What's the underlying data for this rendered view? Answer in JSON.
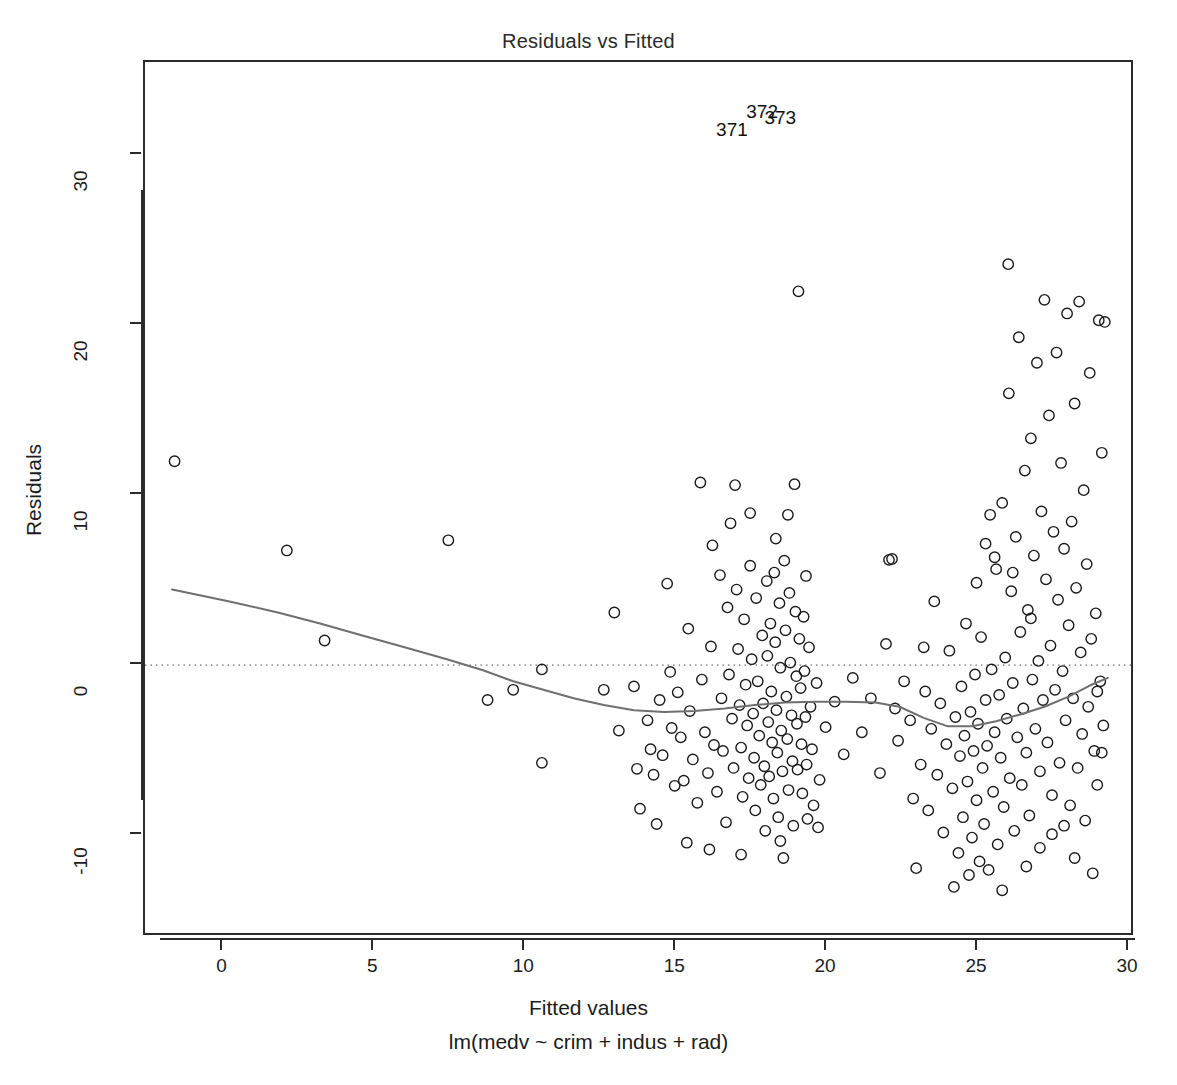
{
  "chart_data": {
    "type": "scatter",
    "title": "Residuals vs Fitted",
    "xlabel": "Fitted values",
    "sublabel": "lm(medv ~ crim + indus + rad)",
    "ylabel": "Residuals",
    "xlim": [
      -2.6,
      30.2
    ],
    "ylim": [
      -16.0,
      35.5
    ],
    "xticks": [
      0,
      5,
      10,
      15,
      20,
      25,
      30
    ],
    "yticks": [
      -10,
      0,
      10,
      20,
      30
    ],
    "grid": false,
    "legend": null,
    "reference_line": {
      "type": "horizontal-dotted",
      "y": 0,
      "color": "#9a9a9a"
    },
    "smoother": {
      "name": "loess",
      "color": "#6f6f6f",
      "width": 2,
      "points": [
        [
          -1.7,
          4.45
        ],
        [
          0.2,
          3.75
        ],
        [
          1.8,
          3.1
        ],
        [
          3.2,
          2.45
        ],
        [
          4.6,
          1.75
        ],
        [
          6.0,
          1.05
        ],
        [
          7.4,
          0.35
        ],
        [
          8.6,
          -0.3
        ],
        [
          9.6,
          -0.95
        ],
        [
          10.6,
          -1.45
        ],
        [
          11.6,
          -1.95
        ],
        [
          12.6,
          -2.35
        ],
        [
          13.6,
          -2.65
        ],
        [
          14.6,
          -2.75
        ],
        [
          15.6,
          -2.7
        ],
        [
          16.6,
          -2.55
        ],
        [
          17.6,
          -2.35
        ],
        [
          18.6,
          -2.2
        ],
        [
          19.6,
          -2.15
        ],
        [
          20.6,
          -2.15
        ],
        [
          21.6,
          -2.2
        ],
        [
          22.4,
          -2.45
        ],
        [
          23.2,
          -3.1
        ],
        [
          24.0,
          -3.6
        ],
        [
          24.8,
          -3.6
        ],
        [
          25.6,
          -3.3
        ],
        [
          26.4,
          -2.9
        ],
        [
          27.2,
          -2.45
        ],
        [
          28.0,
          -1.85
        ],
        [
          28.7,
          -1.2
        ],
        [
          29.3,
          -0.75
        ]
      ]
    },
    "point_labels": [
      {
        "text": "371",
        "x": 17.05,
        "y": 31.3
      },
      {
        "text": "372",
        "x": 18.05,
        "y": 32.4
      },
      {
        "text": "373",
        "x": 18.65,
        "y": 32.0
      }
    ],
    "marker": {
      "shape": "open-circle",
      "radius": 5.2,
      "color": "#1a1a1a",
      "stroke_width": 1.4
    },
    "points": [
      [
        -1.62,
        12.0
      ],
      [
        2.1,
        6.75
      ],
      [
        3.35,
        1.45
      ],
      [
        7.45,
        7.35
      ],
      [
        8.75,
        -2.05
      ],
      [
        9.6,
        -1.45
      ],
      [
        10.55,
        -0.25
      ],
      [
        10.55,
        -5.75
      ],
      [
        12.95,
        3.1
      ],
      [
        13.6,
        -1.25
      ],
      [
        13.7,
        -6.1
      ],
      [
        13.8,
        -8.45
      ],
      [
        14.05,
        -3.25
      ],
      [
        14.15,
        -4.95
      ],
      [
        14.25,
        -6.45
      ],
      [
        14.45,
        -2.05
      ],
      [
        14.55,
        -5.3
      ],
      [
        14.7,
        4.8
      ],
      [
        14.8,
        -0.4
      ],
      [
        14.85,
        -3.7
      ],
      [
        14.95,
        -7.1
      ],
      [
        15.05,
        -1.6
      ],
      [
        15.15,
        -4.25
      ],
      [
        15.25,
        -6.8
      ],
      [
        15.4,
        2.15
      ],
      [
        15.45,
        -2.7
      ],
      [
        15.55,
        -5.55
      ],
      [
        15.7,
        -8.1
      ],
      [
        15.8,
        10.75
      ],
      [
        15.85,
        -0.85
      ],
      [
        15.95,
        -3.95
      ],
      [
        16.05,
        -6.35
      ],
      [
        16.15,
        1.1
      ],
      [
        16.25,
        -4.7
      ],
      [
        16.35,
        -7.45
      ],
      [
        16.45,
        5.3
      ],
      [
        16.5,
        -1.95
      ],
      [
        16.55,
        -5.05
      ],
      [
        16.65,
        -9.25
      ],
      [
        16.7,
        3.4
      ],
      [
        16.75,
        -0.55
      ],
      [
        16.85,
        -3.15
      ],
      [
        16.9,
        -6.05
      ],
      [
        16.95,
        10.6
      ],
      [
        17.0,
        4.45
      ],
      [
        17.05,
        0.95
      ],
      [
        17.1,
        -2.35
      ],
      [
        17.15,
        -4.85
      ],
      [
        17.2,
        -7.75
      ],
      [
        17.25,
        2.7
      ],
      [
        17.3,
        -1.15
      ],
      [
        17.35,
        -3.55
      ],
      [
        17.4,
        -6.65
      ],
      [
        17.45,
        5.85
      ],
      [
        17.5,
        0.35
      ],
      [
        17.55,
        -2.85
      ],
      [
        17.58,
        -5.45
      ],
      [
        17.62,
        -8.55
      ],
      [
        17.65,
        3.95
      ],
      [
        17.7,
        -0.95
      ],
      [
        17.75,
        -4.15
      ],
      [
        17.8,
        -7.05
      ],
      [
        17.85,
        1.75
      ],
      [
        17.88,
        -2.25
      ],
      [
        17.92,
        -5.95
      ],
      [
        17.95,
        -9.75
      ],
      [
        18.0,
        4.95
      ],
      [
        18.02,
        0.55
      ],
      [
        18.05,
        -3.35
      ],
      [
        18.08,
        -6.55
      ],
      [
        18.12,
        2.45
      ],
      [
        18.15,
        -1.55
      ],
      [
        18.18,
        -4.55
      ],
      [
        18.22,
        -7.85
      ],
      [
        18.25,
        5.45
      ],
      [
        18.28,
        1.35
      ],
      [
        18.32,
        -2.65
      ],
      [
        18.35,
        -5.15
      ],
      [
        18.38,
        -8.95
      ],
      [
        18.42,
        3.65
      ],
      [
        18.45,
        -0.15
      ],
      [
        18.48,
        -3.85
      ],
      [
        18.52,
        -6.25
      ],
      [
        18.55,
        -11.35
      ],
      [
        18.58,
        6.15
      ],
      [
        18.62,
        2.05
      ],
      [
        18.65,
        -1.85
      ],
      [
        18.68,
        -4.35
      ],
      [
        18.72,
        -7.35
      ],
      [
        18.75,
        4.25
      ],
      [
        18.78,
        0.15
      ],
      [
        18.82,
        -2.95
      ],
      [
        18.85,
        -5.65
      ],
      [
        18.88,
        -9.45
      ],
      [
        18.92,
        10.65
      ],
      [
        18.95,
        3.15
      ],
      [
        18.98,
        -0.65
      ],
      [
        19.0,
        -3.45
      ],
      [
        19.02,
        -6.15
      ],
      [
        19.05,
        22.0
      ],
      [
        19.08,
        1.55
      ],
      [
        19.12,
        -1.35
      ],
      [
        19.15,
        -4.65
      ],
      [
        19.18,
        -7.55
      ],
      [
        19.22,
        2.85
      ],
      [
        19.25,
        -0.35
      ],
      [
        19.28,
        -3.05
      ],
      [
        19.32,
        -5.85
      ],
      [
        19.35,
        -9.05
      ],
      [
        19.4,
        1.05
      ],
      [
        19.45,
        -2.45
      ],
      [
        19.5,
        -4.95
      ],
      [
        19.55,
        -8.25
      ],
      [
        19.65,
        -1.05
      ],
      [
        19.75,
        -6.75
      ],
      [
        19.95,
        -3.65
      ],
      [
        20.25,
        -2.15
      ],
      [
        20.55,
        -5.25
      ],
      [
        20.85,
        -0.75
      ],
      [
        21.15,
        -3.95
      ],
      [
        21.45,
        -1.95
      ],
      [
        21.75,
        -6.35
      ],
      [
        21.95,
        1.25
      ],
      [
        22.05,
        6.2
      ],
      [
        22.15,
        6.25
      ],
      [
        22.25,
        -2.55
      ],
      [
        22.35,
        -4.45
      ],
      [
        22.55,
        -0.95
      ],
      [
        22.75,
        -3.25
      ],
      [
        22.95,
        -11.95
      ],
      [
        23.1,
        -5.85
      ],
      [
        23.25,
        -1.55
      ],
      [
        23.35,
        -8.55
      ],
      [
        23.45,
        -3.75
      ],
      [
        23.55,
        3.75
      ],
      [
        23.65,
        -6.45
      ],
      [
        23.75,
        -2.25
      ],
      [
        23.85,
        -9.85
      ],
      [
        23.95,
        -4.65
      ],
      [
        24.05,
        0.85
      ],
      [
        24.15,
        -7.25
      ],
      [
        24.25,
        -3.05
      ],
      [
        24.35,
        -11.05
      ],
      [
        24.4,
        -5.35
      ],
      [
        24.45,
        -1.25
      ],
      [
        24.5,
        -8.95
      ],
      [
        24.55,
        -4.15
      ],
      [
        24.6,
        2.45
      ],
      [
        24.65,
        -6.85
      ],
      [
        24.7,
        -12.35
      ],
      [
        24.75,
        -2.75
      ],
      [
        24.8,
        -10.15
      ],
      [
        24.85,
        -5.05
      ],
      [
        24.9,
        -0.55
      ],
      [
        24.95,
        -7.95
      ],
      [
        25.0,
        -3.45
      ],
      [
        25.05,
        -11.55
      ],
      [
        25.1,
        1.65
      ],
      [
        25.15,
        -6.05
      ],
      [
        25.2,
        -9.35
      ],
      [
        25.25,
        -2.05
      ],
      [
        25.3,
        -4.75
      ],
      [
        25.35,
        -12.05
      ],
      [
        25.4,
        8.85
      ],
      [
        25.45,
        -0.25
      ],
      [
        25.5,
        -7.45
      ],
      [
        25.55,
        -3.95
      ],
      [
        25.6,
        5.65
      ],
      [
        25.65,
        -10.55
      ],
      [
        25.7,
        -1.75
      ],
      [
        25.75,
        -5.45
      ],
      [
        25.8,
        9.55
      ],
      [
        25.85,
        -8.35
      ],
      [
        25.9,
        0.45
      ],
      [
        25.95,
        -3.15
      ],
      [
        26.0,
        23.6
      ],
      [
        26.02,
        16.0
      ],
      [
        26.05,
        -6.65
      ],
      [
        26.1,
        4.35
      ],
      [
        26.15,
        -1.05
      ],
      [
        26.2,
        -9.75
      ],
      [
        26.25,
        7.55
      ],
      [
        26.3,
        -4.25
      ],
      [
        26.35,
        19.3
      ],
      [
        26.4,
        1.95
      ],
      [
        26.45,
        -7.05
      ],
      [
        26.5,
        -2.55
      ],
      [
        26.55,
        11.45
      ],
      [
        26.6,
        -5.15
      ],
      [
        26.65,
        3.25
      ],
      [
        26.7,
        -8.85
      ],
      [
        26.75,
        13.35
      ],
      [
        26.8,
        -0.85
      ],
      [
        26.85,
        6.45
      ],
      [
        26.9,
        -3.75
      ],
      [
        26.95,
        17.8
      ],
      [
        27.0,
        0.25
      ],
      [
        27.05,
        -6.25
      ],
      [
        27.1,
        9.05
      ],
      [
        27.15,
        -2.05
      ],
      [
        27.2,
        21.5
      ],
      [
        27.25,
        5.05
      ],
      [
        27.3,
        -4.55
      ],
      [
        27.35,
        14.7
      ],
      [
        27.4,
        1.15
      ],
      [
        27.45,
        -7.65
      ],
      [
        27.5,
        7.85
      ],
      [
        27.55,
        -1.45
      ],
      [
        27.6,
        18.4
      ],
      [
        27.65,
        3.85
      ],
      [
        27.7,
        -5.75
      ],
      [
        27.75,
        11.9
      ],
      [
        27.8,
        -0.35
      ],
      [
        27.85,
        6.85
      ],
      [
        27.9,
        -3.25
      ],
      [
        27.95,
        20.7
      ],
      [
        28.0,
        2.35
      ],
      [
        28.05,
        -8.25
      ],
      [
        28.1,
        8.45
      ],
      [
        28.15,
        -1.95
      ],
      [
        28.2,
        15.4
      ],
      [
        28.25,
        4.55
      ],
      [
        28.3,
        -6.05
      ],
      [
        28.35,
        21.4
      ],
      [
        28.4,
        0.75
      ],
      [
        28.45,
        -4.05
      ],
      [
        28.5,
        10.3
      ],
      [
        28.55,
        -9.15
      ],
      [
        28.6,
        5.95
      ],
      [
        28.65,
        -2.45
      ],
      [
        28.7,
        17.2
      ],
      [
        28.75,
        1.55
      ],
      [
        28.8,
        -12.25
      ],
      [
        28.85,
        -5.05
      ],
      [
        28.9,
        3.05
      ],
      [
        28.95,
        -7.05
      ],
      [
        29.0,
        20.3
      ],
      [
        29.05,
        -0.95
      ],
      [
        29.1,
        12.5
      ],
      [
        29.15,
        -3.55
      ],
      [
        29.2,
        20.2
      ],
      [
        16.2,
        7.05
      ],
      [
        16.8,
        8.35
      ],
      [
        17.45,
        8.95
      ],
      [
        18.3,
        7.45
      ],
      [
        18.7,
        8.85
      ],
      [
        19.3,
        5.25
      ],
      [
        23.2,
        1.05
      ],
      [
        24.2,
        -13.05
      ],
      [
        25.8,
        -13.25
      ],
      [
        26.6,
        -11.85
      ],
      [
        12.6,
        -1.45
      ],
      [
        13.1,
        -3.85
      ],
      [
        14.35,
        -9.35
      ],
      [
        15.35,
        -10.45
      ],
      [
        16.1,
        -10.85
      ],
      [
        17.15,
        -11.15
      ],
      [
        18.45,
        -10.35
      ],
      [
        19.7,
        -9.55
      ],
      [
        22.85,
        -7.85
      ],
      [
        27.05,
        -10.75
      ],
      [
        27.85,
        -9.45
      ],
      [
        28.2,
        -11.35
      ],
      [
        25.25,
        7.15
      ],
      [
        25.55,
        6.35
      ],
      [
        26.15,
        5.45
      ],
      [
        24.95,
        4.85
      ],
      [
        26.75,
        2.75
      ],
      [
        27.45,
        -9.95
      ],
      [
        29.1,
        -5.15
      ],
      [
        28.95,
        -1.55
      ]
    ]
  }
}
